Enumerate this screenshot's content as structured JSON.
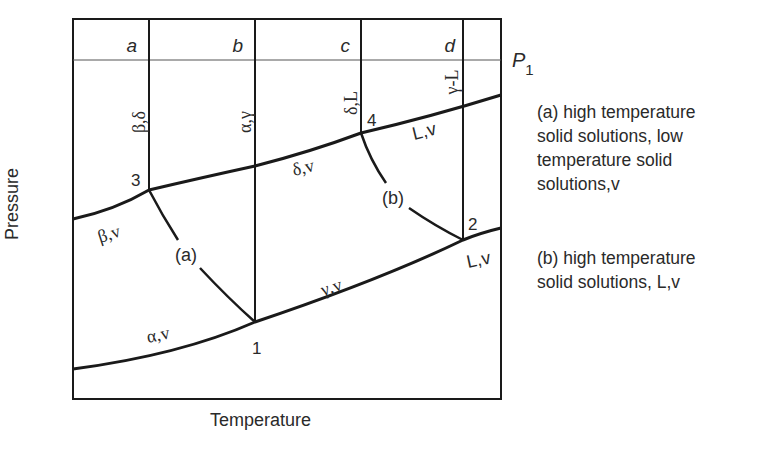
{
  "diagram": {
    "type": "pressure-temperature phase diagram",
    "axes": {
      "x_label": "Temperature",
      "y_label": "Pressure"
    },
    "isobar": {
      "label": "P",
      "subscript": "1"
    },
    "column_labels": [
      "a",
      "b",
      "c",
      "d"
    ],
    "vertical_boundary_labels": [
      "β,δ",
      "α,γ",
      "δ,L",
      "γ-L"
    ],
    "points": [
      "1",
      "2",
      "3",
      "4"
    ],
    "region_labels": {
      "beta_v": "β,v",
      "alpha_v": "α,v",
      "delta_v": "δ,v",
      "gamma_v": "γ,v",
      "L_v_upper": "L,v",
      "L_v_lower": "L,v"
    },
    "curve_labels": [
      "(a)",
      "(b)"
    ],
    "colors": {
      "line": "#1a1a1a",
      "text": "#2a2a2a",
      "background": "#ffffff"
    }
  },
  "legend": {
    "a_lines": [
      "(a) high temperature",
      "solid solutions, low",
      "temperature solid",
      "solutions,v"
    ],
    "b_lines": [
      "(b) high temperature",
      "solid solutions, L,v"
    ]
  }
}
